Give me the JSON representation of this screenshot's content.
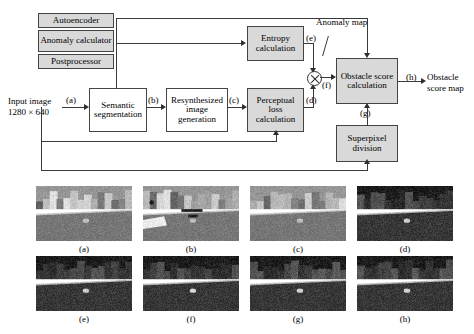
{
  "figure": {
    "type": "block-diagram-with-image-grid",
    "line_color": "#3a3a3a",
    "process_fill": "#d9d9d9",
    "plain_fill": "#ffffff"
  },
  "legend": {
    "items": [
      {
        "label": "Autoencoder",
        "fill": "#d9d9d9"
      },
      {
        "label": "Anomaly calculator",
        "fill": "#d9d9d9"
      },
      {
        "label": "Postprocessor",
        "fill": "#d9d9d9"
      }
    ]
  },
  "diagram": {
    "input": {
      "line1": "Input image",
      "line2": "1280 × 640"
    },
    "output": {
      "line1": "Obstacle",
      "line2": "score map"
    },
    "anomaly_map_label": "Anomaly map",
    "nodes": [
      {
        "id": "semantic",
        "label": "Semantic segmentation",
        "fill": "plain"
      },
      {
        "id": "resynth",
        "label": "Resynthesized image generation",
        "fill": "plain"
      },
      {
        "id": "perceptual",
        "label": "Perceptual loss calculation",
        "fill": "proc"
      },
      {
        "id": "entropy",
        "label": "Entropy calculation",
        "fill": "proc"
      },
      {
        "id": "obstacle",
        "label": "Obstacle score calculation",
        "fill": "proc"
      },
      {
        "id": "superpixel",
        "label": "Superpixel division",
        "fill": "proc"
      }
    ],
    "edge_labels": [
      "(a)",
      "(b)",
      "(c)",
      "(d)",
      "(e)",
      "(f)",
      "(g)",
      "(h)"
    ],
    "operator": "multiply"
  },
  "image_grid": {
    "rows": 2,
    "cols": 4,
    "captions": [
      "(a)",
      "(b)",
      "(c)",
      "(d)",
      "(e)",
      "(f)",
      "(g)",
      "(h)"
    ]
  }
}
